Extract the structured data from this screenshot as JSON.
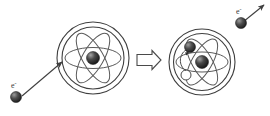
{
  "figure": {
    "background_color": "#ffffff",
    "stroke_color": "#3f3f3f",
    "width": 270,
    "height": 116
  },
  "labels": {
    "incoming_electron": "e",
    "incoming_electron_charge": "-",
    "ejected_electron": "e",
    "ejected_electron_charge": "-"
  },
  "left_atom": {
    "name": "neutral-atom-before",
    "center": {
      "x": 93,
      "y": 58
    },
    "outer_radius": 36,
    "inner_radius": 31,
    "nucleus_radius": 6.5,
    "orbit_count": 3,
    "orbit_angles_deg": [
      0,
      60,
      120
    ],
    "orbit_rx": 28,
    "orbit_ry": 10.5
  },
  "right_atom": {
    "name": "ionized-atom-after",
    "center": {
      "x": 202,
      "y": 62
    },
    "outer_radius": 33,
    "inner_radius": 28.5,
    "nucleus_radius": 6.5,
    "orbit_count": 3,
    "orbit_angles_deg": [
      0,
      60,
      120
    ],
    "orbit_rx": 26,
    "orbit_ry": 10,
    "bound_electron": {
      "x": 189,
      "y": 47,
      "radius": 5.5
    },
    "vacancy_hole": {
      "x": 186,
      "y": 75,
      "radius": 5
    }
  },
  "arrows": {
    "incoming_label": "incoming electron trajectory",
    "incoming_from": {
      "x": 22,
      "y": 96
    },
    "incoming_to": {
      "x": 62,
      "y": 62
    },
    "ejected_label": "ejected electron trajectory",
    "ejected_from": {
      "x": 243,
      "y": 22
    },
    "ejected_to": {
      "x": 264,
      "y": 5
    },
    "transition_label": "leads to",
    "transition_from": {
      "x": 137,
      "y": 60
    },
    "transition_to": {
      "x": 161,
      "y": 60
    }
  },
  "electrons": {
    "incoming_sphere": {
      "x": 16,
      "y": 97,
      "radius": 5.5
    },
    "ejected_sphere": {
      "x": 241,
      "y": 23,
      "radius": 5.5
    }
  }
}
